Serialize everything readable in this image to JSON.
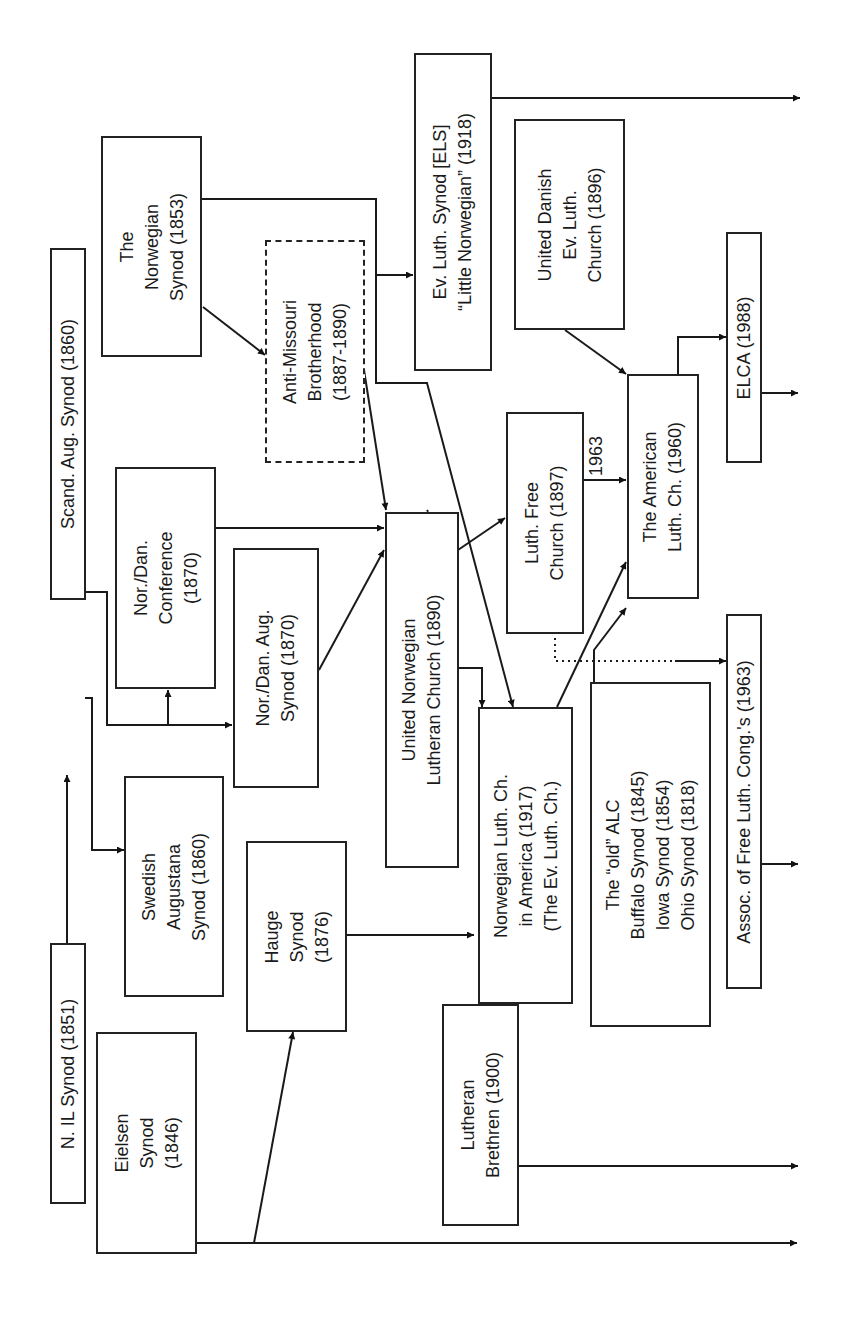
{
  "orientation": "rotated 90 degrees counter-clockwise; timeline flows left-to-right on page",
  "nodes": {
    "n_il_synod": {
      "label": "N. IL Synod (1851)"
    },
    "eielsen_synod": {
      "label": "Eielsen\nSynod\n(1846)"
    },
    "scand_aug_synod": {
      "label": "Scand. Aug. Synod (1860)"
    },
    "norwegian_synod": {
      "label": "The\nNorwegian\nSynod (1853)"
    },
    "swedish_augustana": {
      "label": "Swedish\nAugustana\nSynod (1860)"
    },
    "hauge_synod": {
      "label": "Hauge\nSynod\n(1876)"
    },
    "nor_dan_conference": {
      "label": "Nor./Dan.\nConference\n(1870)"
    },
    "nor_dan_aug_synod": {
      "label": "Nor./Dan. Aug.\nSynod (1870)"
    },
    "anti_missouri": {
      "label": "Anti-Missouri\nBrotherhood\n(1887-1890)"
    },
    "lutheran_brethren": {
      "label": "Lutheran\nBrethren (1900)"
    },
    "united_norwegian": {
      "label": "United Norwegian\nLutheran Church (1890)"
    },
    "els": {
      "label": "Ev. Luth. Synod [ELS]\n“Little Norwegian” (1918)"
    },
    "luth_free_church": {
      "label": "Luth. Free\nChurch (1897)"
    },
    "norwegian_luth_america": {
      "label": "Norwegian Luth. Ch.\nin America (1917)\n(The Ev. Luth. Ch.)"
    },
    "united_danish": {
      "label": "United Danish\nEv. Luth.\nChurch (1896)"
    },
    "old_alc": {
      "label": "The “old” ALC\nBuffalo Synod (1845)\nIowa Synod (1854)\nOhio Synod (1818)"
    },
    "american_luth": {
      "label": "The American\nLuth. Ch. (1960)"
    },
    "elca": {
      "label": "ELCA (1988)"
    },
    "aflc": {
      "label": "Assoc. of Free Luth. Cong.'s (1963)"
    }
  },
  "annotations": {
    "year_1963": "1963"
  },
  "edges": [
    {
      "from": "N. IL Synod (1851)",
      "to": "Scand. Aug. Synod (1860)"
    },
    {
      "from": "Scand. Aug. Synod (1860)",
      "to": "Swedish Augustana Synod (1860)"
    },
    {
      "from": "Scand. Aug. Synod (1860)",
      "to": "Nor./Dan. Conference (1870)"
    },
    {
      "from": "Scand. Aug. Synod (1860)",
      "to": "Nor./Dan. Aug. Synod (1870)"
    },
    {
      "from": "Eielsen Synod (1846)",
      "to": "Hauge Synod (1876)"
    },
    {
      "from": "Eielsen Synod (1846)",
      "to": "continues"
    },
    {
      "from": "The Norwegian Synod (1853)",
      "to": "Anti-Missouri Brotherhood (1887-1890)"
    },
    {
      "from": "The Norwegian Synod (1853)",
      "to": "Ev. Luth. Synod [ELS] (1918)"
    },
    {
      "from": "The Norwegian Synod (1853)",
      "to": "Norwegian Luth. Ch. in America (1917)"
    },
    {
      "from": "Anti-Missouri Brotherhood (1887-1890)",
      "to": "United Norwegian Lutheran Church (1890)"
    },
    {
      "from": "Nor./Dan. Conference (1870)",
      "to": "United Norwegian Lutheran Church (1890)"
    },
    {
      "from": "Nor./Dan. Aug. Synod (1870)",
      "to": "United Norwegian Lutheran Church (1890)"
    },
    {
      "from": "United Norwegian Lutheran Church (1890)",
      "to": "Luth. Free Church (1897)"
    },
    {
      "from": "United Norwegian Lutheran Church (1890)",
      "to": "Norwegian Luth. Ch. in America (1917)"
    },
    {
      "from": "Hauge Synod (1876)",
      "to": "Norwegian Luth. Ch. in America (1917)"
    },
    {
      "from": "Norwegian Luth. Ch. in America (1917)",
      "to": "The American Luth. Ch. (1960)"
    },
    {
      "from": "Luth. Free Church (1897)",
      "to": "The American Luth. Ch. (1960)",
      "label": "1963"
    },
    {
      "from": "Luth. Free Church (1897)",
      "to": "Assoc. of Free Luth. Cong.'s (1963)",
      "style": "dotted"
    },
    {
      "from": "The old ALC",
      "to": "The American Luth. Ch. (1960)"
    },
    {
      "from": "United Danish Ev. Luth. Church (1896)",
      "to": "The American Luth. Ch. (1960)"
    },
    {
      "from": "The American Luth. Ch. (1960)",
      "to": "ELCA (1988)"
    },
    {
      "from": "ELCA (1988)",
      "to": "continues"
    },
    {
      "from": "Ev. Luth. Synod [ELS] (1918)",
      "to": "continues"
    },
    {
      "from": "Assoc. of Free Luth. Cong.'s (1963)",
      "to": "continues"
    },
    {
      "from": "Lutheran Brethren (1900)",
      "to": "continues"
    }
  ]
}
